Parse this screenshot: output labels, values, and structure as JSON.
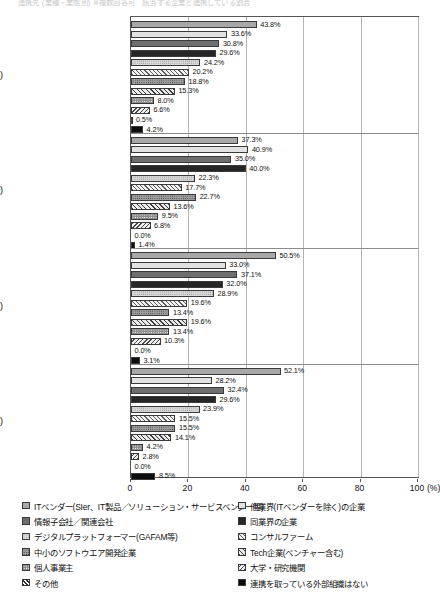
{
  "title_faint": "連携先 (業種・業態別)  ※複数回答可　該当する企業と連携している割合",
  "axis": {
    "unit": "(%)",
    "ticks": [
      0,
      20,
      40,
      60,
      80,
      100
    ],
    "tick_labels": [
      "0",
      "20",
      "40",
      "60",
      "80",
      "100"
    ],
    "xlim": [
      0,
      100
    ]
  },
  "legend": {
    "left_column": [
      "ITベンダー(SIer、IT製品／ソリューション・サービスベンダー等)",
      "情報子会社／関連会社",
      "デジタルプラットフォーマー(GAFAM等)",
      "中小のソフトウエア開発企業",
      "個人事業主",
      "その他"
    ],
    "right_column": [
      "他業界(ITベンダーを除く)の企業",
      "同業界の企業",
      "コンサルファーム",
      "Tech企業(ベンチャー含む)",
      "大学・研究機関",
      "連携を取っている外部組織はない"
    ]
  },
  "chart_data": {
    "type": "bar",
    "orientation": "horizontal",
    "title": "連携先 (業種・業態別)",
    "xlabel": "(%)",
    "ylabel": "",
    "xlim": [
      0,
      100
    ],
    "grid": true,
    "legend_position": "bottom",
    "categories": [
      "生成AI(n=425)",
      "アプリケーション系(n=220)",
      "インフラ・基盤系(n=97)",
      "開発手法・メソドロジ(n=71)"
    ],
    "series": [
      {
        "name": "ITベンダー(SIer、IT製品／ソリューション・サービスベンダー等)",
        "values": [
          43.8,
          37.3,
          50.5,
          52.1
        ]
      },
      {
        "name": "他業界(ITベンダーを除く)の企業",
        "values": [
          33.6,
          40.9,
          33.0,
          28.2
        ]
      },
      {
        "name": "情報子会社／関連会社",
        "values": [
          30.8,
          35.0,
          37.1,
          32.4
        ]
      },
      {
        "name": "同業界の企業",
        "values": [
          29.6,
          40.0,
          32.0,
          29.6
        ]
      },
      {
        "name": "デジタルプラットフォーマー(GAFAM等)",
        "values": [
          24.2,
          22.3,
          28.9,
          23.9
        ]
      },
      {
        "name": "コンサルファーム",
        "values": [
          20.2,
          17.7,
          19.6,
          15.5
        ]
      },
      {
        "name": "中小のソフトウエア開発企業",
        "values": [
          18.8,
          22.7,
          13.4,
          15.5
        ]
      },
      {
        "name": "Tech企業(ベンチャー含む)",
        "values": [
          15.3,
          13.6,
          19.6,
          14.1
        ]
      },
      {
        "name": "個人事業主",
        "values": [
          8.0,
          9.5,
          13.4,
          4.2
        ]
      },
      {
        "name": "大学・研究機関",
        "values": [
          6.6,
          6.8,
          10.3,
          2.8
        ]
      },
      {
        "name": "その他",
        "values": [
          0.5,
          0.0,
          0.0,
          0.0
        ]
      },
      {
        "name": "連携を取っている外部組織はない",
        "values": [
          4.2,
          1.4,
          3.1,
          8.5
        ]
      }
    ],
    "value_labels": [
      [
        "43.8%",
        "33.6%",
        "30.8%",
        "29.6%",
        "24.2%",
        "20.2%",
        "18.8%",
        "15.3%",
        "8.0%",
        "6.6%",
        "0.5%",
        "4.2%"
      ],
      [
        "37.3%",
        "40.9%",
        "35.0%",
        "40.0%",
        "22.3%",
        "17.7%",
        "22.7%",
        "13.6%",
        "9.5%",
        "6.8%",
        "0.0%",
        "1.4%"
      ],
      [
        "50.5%",
        "33.0%",
        "37.1%",
        "32.0%",
        "28.9%",
        "19.6%",
        "13.4%",
        "19.6%",
        "13.4%",
        "10.3%",
        "0.0%",
        "3.1%"
      ],
      [
        "52.1%",
        "28.2%",
        "32.4%",
        "29.6%",
        "23.9%",
        "15.5%",
        "15.5%",
        "14.1%",
        "4.2%",
        "2.8%",
        "0.0%",
        "8.5%"
      ]
    ]
  }
}
